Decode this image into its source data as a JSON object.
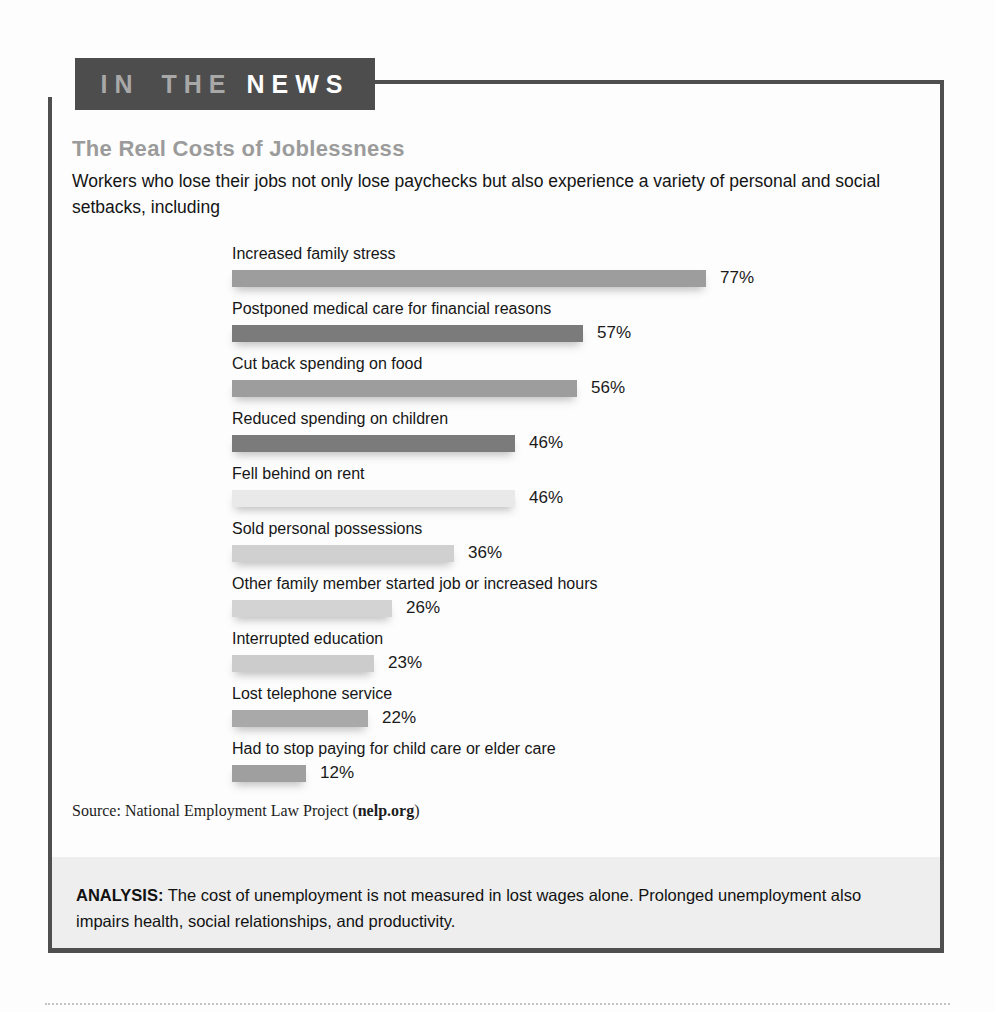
{
  "header": {
    "badge_part1": "IN THE",
    "badge_part2": "NEWS"
  },
  "article": {
    "title": "The Real Costs of Joblessness",
    "intro": "Workers who lose their jobs not only lose paychecks but also experience a variety of personal and social setbacks, including",
    "source_prefix": "Source: National Employment Law Project (",
    "source_link": "nelp.org",
    "source_suffix": ")"
  },
  "chart_data": {
    "type": "bar",
    "orientation": "horizontal",
    "title": "The Real Costs of Joblessness",
    "categories": [
      "Increased family stress",
      "Postponed medical care for financial reasons",
      "Cut back spending on food",
      "Reduced spending on children",
      "Fell behind on rent",
      "Sold personal possessions",
      "Other family member started job or increased hours",
      "Interrupted education",
      "Lost telephone service",
      "Had to stop paying for child care or elder care"
    ],
    "values": [
      77,
      57,
      56,
      46,
      46,
      36,
      26,
      23,
      22,
      12
    ],
    "value_suffix": "%",
    "value_labels": "outside-end",
    "xlim": [
      0,
      80
    ],
    "grid": false,
    "legend": "none",
    "bar_colors": [
      "#9d9d9d",
      "#7b7b7b",
      "#9d9d9d",
      "#7b7b7b",
      "#e9e9e9",
      "#d0d0d0",
      "#d3d3d3",
      "#cccccc",
      "#a9a9a9",
      "#9f9f9f"
    ]
  },
  "analysis": {
    "label": "ANALYSIS:",
    "text": " The cost of unemployment is not measured in lost wages alone. Prolonged unemployment also impairs health, social relationships, and productivity."
  },
  "colors": {
    "badge_bg": "#4d4d4d",
    "badge_text_secondary": "#a8a8a8",
    "badge_text_primary": "#ffffff",
    "frame_border": "#4f4f4f",
    "title_color": "#9b9b9b",
    "analysis_bg": "#eeeeee"
  }
}
